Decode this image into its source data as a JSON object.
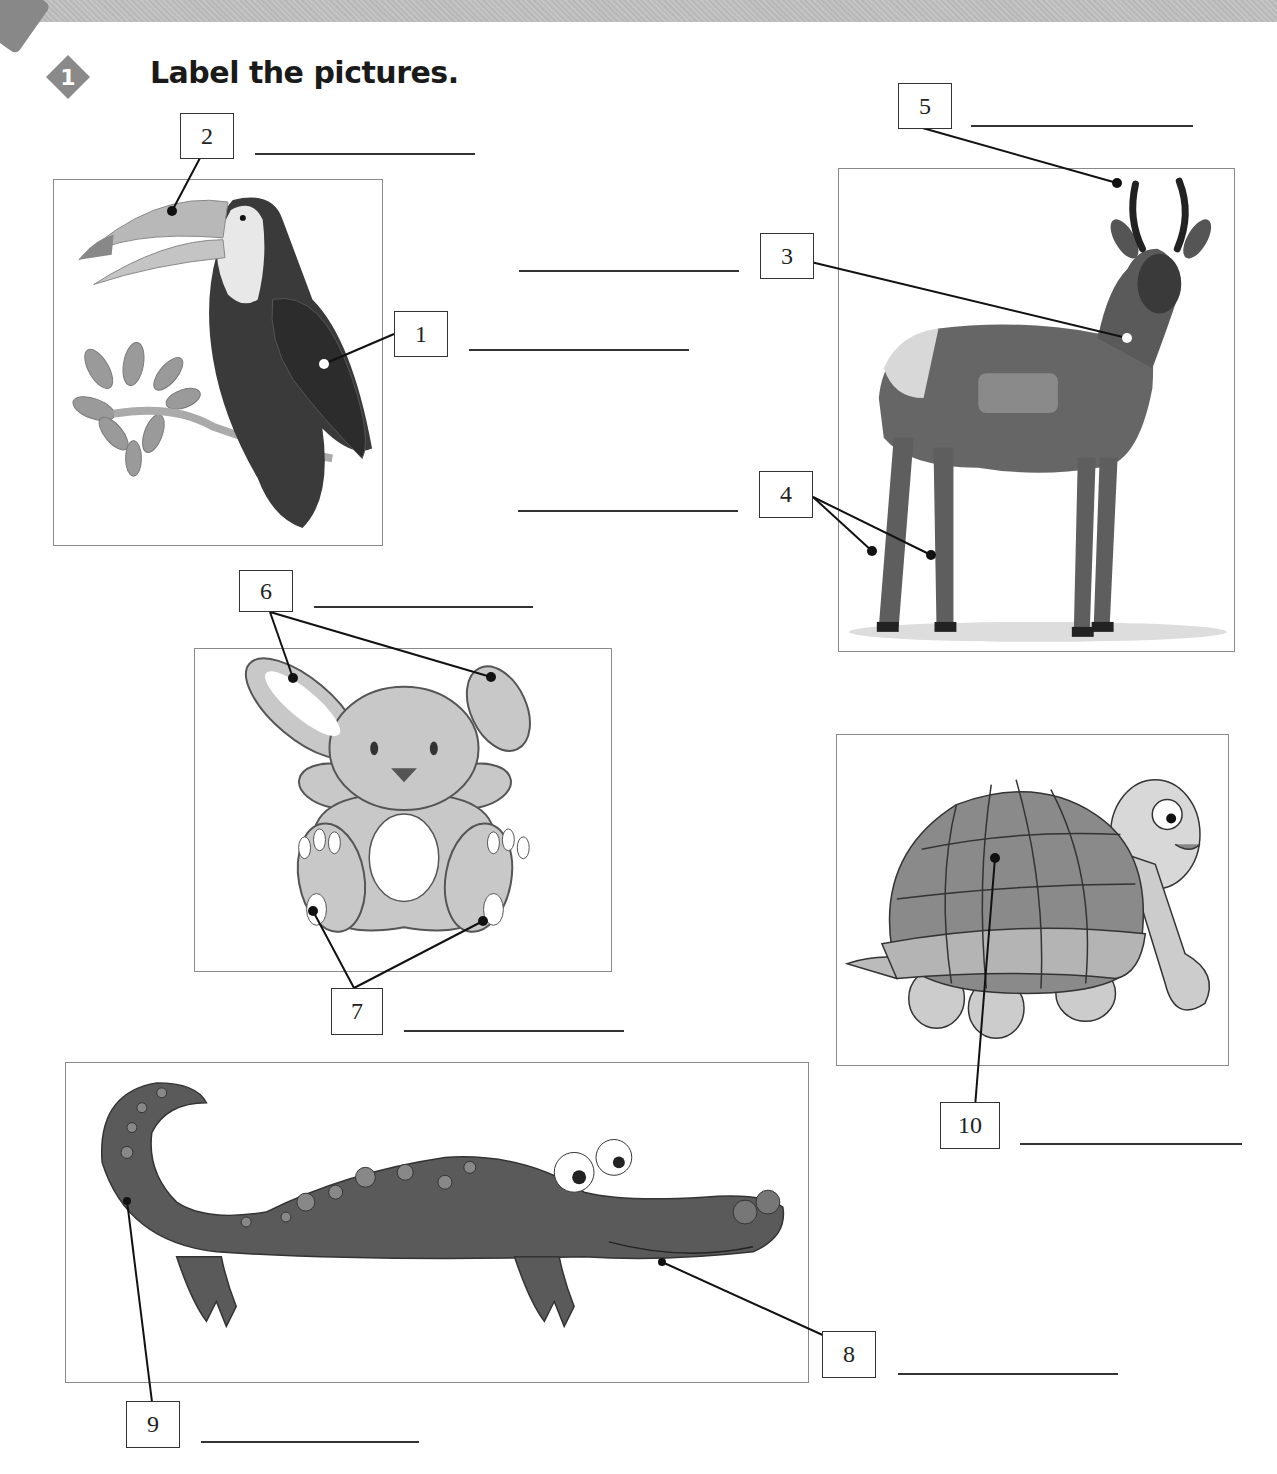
{
  "exercise": {
    "number": "1",
    "instruction": "Label the pictures."
  },
  "labels": [
    {
      "number": "1",
      "animal": "toucan",
      "answer": ""
    },
    {
      "number": "2",
      "animal": "toucan",
      "answer": ""
    },
    {
      "number": "3",
      "animal": "antelope",
      "answer": ""
    },
    {
      "number": "4",
      "animal": "antelope",
      "answer": ""
    },
    {
      "number": "5",
      "animal": "antelope",
      "answer": ""
    },
    {
      "number": "6",
      "animal": "rabbit",
      "answer": ""
    },
    {
      "number": "7",
      "animal": "rabbit",
      "answer": ""
    },
    {
      "number": "8",
      "animal": "crocodile",
      "answer": ""
    },
    {
      "number": "9",
      "animal": "crocodile",
      "answer": ""
    },
    {
      "number": "10",
      "animal": "tortoise",
      "answer": ""
    }
  ],
  "colors": {
    "header_band": "#bebebe",
    "badge": "#8a8a8a",
    "frame_border": "#8a8a8a",
    "ink": "#222222"
  }
}
